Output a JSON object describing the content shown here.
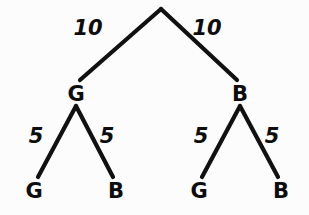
{
  "diagram": {
    "background_color": "#fcfcfc",
    "stroke_color": "#111111",
    "text_color": "#0d0d0d",
    "nodes": [
      {
        "id": "root",
        "label": "",
        "x": 161,
        "y": 9,
        "level": 0
      },
      {
        "id": "n-g",
        "label": "G",
        "x": 76,
        "y": 93,
        "level": 1
      },
      {
        "id": "n-b",
        "label": "B",
        "x": 240,
        "y": 93,
        "level": 1
      },
      {
        "id": "n-g-g",
        "label": "G",
        "x": 34,
        "y": 190,
        "level": 2
      },
      {
        "id": "n-g-b",
        "label": "B",
        "x": 116,
        "y": 190,
        "level": 2
      },
      {
        "id": "n-b-g",
        "label": "G",
        "x": 199,
        "y": 190,
        "level": 2
      },
      {
        "id": "n-b-b",
        "label": "B",
        "x": 281,
        "y": 190,
        "level": 2
      }
    ],
    "edges": [
      {
        "id": "e-root-g",
        "from": "root",
        "to": "n-g",
        "x1": 161,
        "y1": 9,
        "x2": 80,
        "y2": 80,
        "weight": "10",
        "label_x": 88,
        "label_y": 35
      },
      {
        "id": "e-root-b",
        "from": "root",
        "to": "n-b",
        "x1": 161,
        "y1": 9,
        "x2": 237,
        "y2": 80,
        "weight": "10",
        "label_x": 207,
        "label_y": 35
      },
      {
        "id": "e-g-g",
        "from": "n-g",
        "to": "n-g-g",
        "x1": 76,
        "y1": 106,
        "x2": 38,
        "y2": 177,
        "weight": "5",
        "label_x": 36,
        "label_y": 143
      },
      {
        "id": "e-g-b",
        "from": "n-g",
        "to": "n-g-b",
        "x1": 76,
        "y1": 106,
        "x2": 113,
        "y2": 177,
        "weight": "5",
        "label_x": 107,
        "label_y": 143
      },
      {
        "id": "e-b-g",
        "from": "n-b",
        "to": "n-b-g",
        "x1": 240,
        "y1": 106,
        "x2": 202,
        "y2": 177,
        "weight": "5",
        "label_x": 201,
        "label_y": 143
      },
      {
        "id": "e-b-b",
        "from": "n-b",
        "to": "n-b-b",
        "x1": 240,
        "y1": 106,
        "x2": 278,
        "y2": 177,
        "weight": "5",
        "label_x": 272,
        "label_y": 143
      }
    ]
  }
}
